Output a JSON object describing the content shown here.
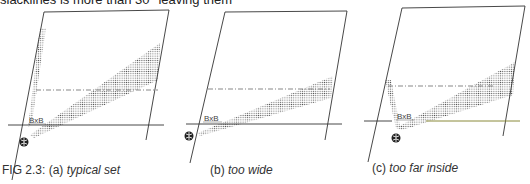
{
  "header_fragment": "slacklines is more than 30° leaving them",
  "figure": {
    "number_label": "FIG 2.3:",
    "panels": [
      {
        "id": "a",
        "tag": "(a)",
        "title": "typical set",
        "label": "BxB"
      },
      {
        "id": "b",
        "tag": "(b)",
        "title": "too wide",
        "label": "BxB"
      },
      {
        "id": "c",
        "tag": "(c)",
        "title": "too far inside",
        "label": "BxB"
      }
    ]
  },
  "colors": {
    "line": "#333333",
    "dots": "#555555",
    "baseline_c": "#8a8a3a"
  }
}
